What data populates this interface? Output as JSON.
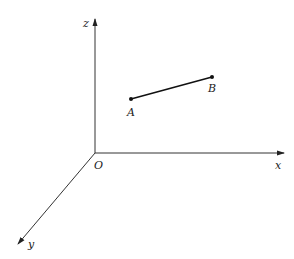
{
  "diagram": {
    "type": "3d-coordinate-axes-with-segment",
    "axes": {
      "x": {
        "label": "x"
      },
      "y": {
        "label": "y"
      },
      "z": {
        "label": "z"
      },
      "origin": {
        "label": "O"
      }
    },
    "points": [
      {
        "label": "A"
      },
      {
        "label": "B"
      }
    ],
    "segment": {
      "from": "A",
      "to": "B"
    },
    "colors": {
      "axis": "#333333",
      "segment": "#111111",
      "background": "#ffffff"
    }
  }
}
